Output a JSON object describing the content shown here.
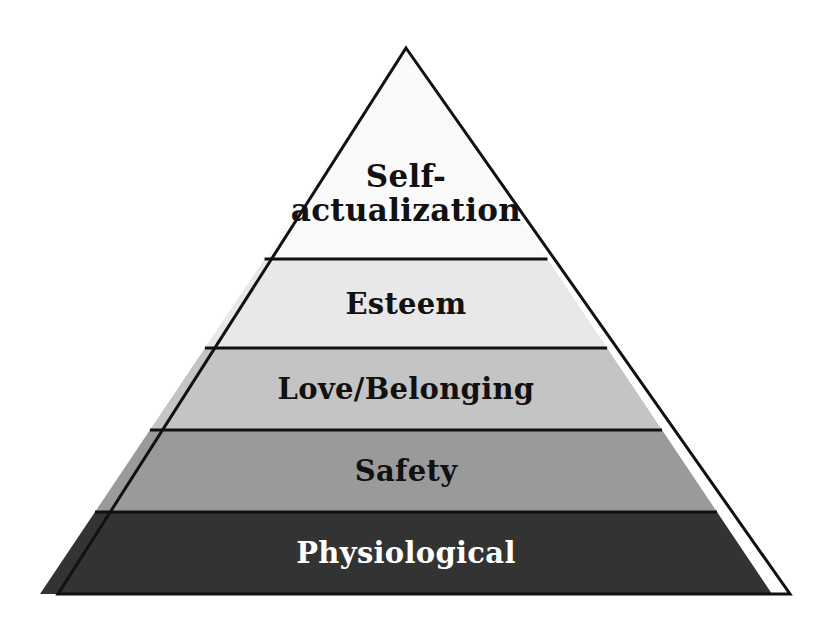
{
  "figure": {
    "name": "Maslow's Hierarchy of Needs pyramid",
    "background_color": "#ffffff",
    "outline_color": "#111111",
    "outline_width": 3,
    "apex": {
      "x": 406,
      "y": 48
    },
    "base_left": {
      "x": 58,
      "y": 594
    },
    "base_right": {
      "x": 790,
      "y": 594
    }
  },
  "chart_data": {
    "type": "pyramid",
    "orientation": "apex-up",
    "level_count": 5,
    "categories": [
      "Self-actualization",
      "Esteem",
      "Love/Belonging",
      "Safety",
      "Physiological"
    ],
    "values": [
      1,
      2,
      3,
      4,
      5
    ],
    "legend": "none",
    "grid": false
  },
  "levels": [
    {
      "rank": 1,
      "label": "Self-\nactualization",
      "label_line1": "Self-",
      "label_line2": "actualization",
      "fill": "#fafafa",
      "text_color": "#111111",
      "y_top": 48,
      "y_bottom": 259,
      "font_size": 31
    },
    {
      "rank": 2,
      "label": "Esteem",
      "fill": "#e8e8e8",
      "text_color": "#111111",
      "y_top": 259,
      "y_bottom": 348,
      "font_size": 29
    },
    {
      "rank": 3,
      "label": "Love/Belonging",
      "fill": "#c4c4c4",
      "text_color": "#111111",
      "y_top": 348,
      "y_bottom": 430,
      "font_size": 29
    },
    {
      "rank": 4,
      "label": "Safety",
      "fill": "#9a9a9a",
      "text_color": "#111111",
      "y_top": 430,
      "y_bottom": 512,
      "font_size": 29
    },
    {
      "rank": 5,
      "label": "Physiological",
      "fill": "#333333",
      "text_color": "#ffffff",
      "y_top": 512,
      "y_bottom": 594,
      "font_size": 29
    }
  ]
}
